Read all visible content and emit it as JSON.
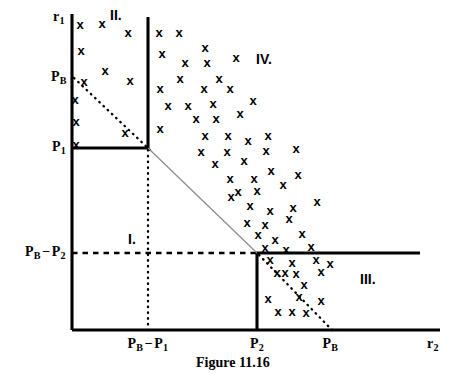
{
  "figure": {
    "caption": "Figure 11.16",
    "axes": {
      "y_label_base": "r",
      "y_label_sub": "1",
      "x_label_base": "r",
      "x_label_sub": "2"
    },
    "y_ticks": [
      {
        "name": "pb",
        "base": "P",
        "sub": "B",
        "y": 78
      },
      {
        "name": "p1",
        "base": "P",
        "sub": "1",
        "y": 148
      },
      {
        "name": "pb-minus-p2",
        "base": "P",
        "sub": "B",
        "op": "−",
        "base2": "P",
        "sub2": "2",
        "y": 253
      }
    ],
    "x_ticks": [
      {
        "name": "pb-minus-p1",
        "base": "P",
        "sub": "B",
        "op": "−",
        "base2": "P",
        "sub2": "1",
        "x": 148
      },
      {
        "name": "p2",
        "base": "P",
        "sub": "2",
        "x": 257
      },
      {
        "name": "pb",
        "base": "P",
        "sub": "B",
        "x": 330
      }
    ],
    "regions": [
      {
        "name": "region-one",
        "label": "I.",
        "x": 128,
        "y": 232
      },
      {
        "name": "region-two",
        "label": "II.",
        "x": 110,
        "y": 8
      },
      {
        "name": "region-three",
        "label": "III.",
        "x": 360,
        "y": 272
      },
      {
        "name": "region-four",
        "label": "IV.",
        "x": 256,
        "y": 52
      }
    ],
    "geometry": {
      "origin": {
        "x": 72,
        "y": 330
      },
      "y_axis_top": 14,
      "x_axis_right": 440,
      "bold_vertical_x": 148,
      "bold_vertical_top": 17,
      "bold_horizontal_p1_y": 148,
      "corner_p2": {
        "x": 257,
        "y": 253
      },
      "bold_horizontal_right_end": 420
    },
    "colors": {
      "ink": "#000000",
      "thin_diagonal": "#8a8a8a",
      "background": "#ffffff"
    },
    "lines": [
      {
        "name": "y-axis",
        "style": "solid-bold",
        "x1": 72,
        "y1": 14,
        "x2": 72,
        "y2": 330
      },
      {
        "name": "x-axis",
        "style": "solid-bold",
        "x1": 72,
        "y1": 330,
        "x2": 440,
        "y2": 330
      },
      {
        "name": "boundary-vertical-pb-minus-p1",
        "style": "solid-bold",
        "x1": 148,
        "y1": 17,
        "x2": 148,
        "y2": 149
      },
      {
        "name": "boundary-horizontal-p1",
        "style": "solid-bold",
        "x1": 72,
        "y1": 148,
        "x2": 149,
        "y2": 148
      },
      {
        "name": "boundary-vertical-p2",
        "style": "solid-bold",
        "x1": 257,
        "y1": 253,
        "x2": 257,
        "y2": 330
      },
      {
        "name": "boundary-horizontal-pb-minus-p2",
        "style": "solid-bold",
        "x1": 256,
        "y1": 253,
        "x2": 420,
        "y2": 253
      },
      {
        "name": "dotted-vertical-pb-minus-p1",
        "style": "dotted",
        "x1": 148,
        "y1": 150,
        "x2": 148,
        "y2": 330
      },
      {
        "name": "dotted-horizontal-pb-minus-p2",
        "style": "dashed",
        "x1": 72,
        "y1": 253,
        "x2": 256,
        "y2": 253
      },
      {
        "name": "dotted-diagonal-region-two",
        "style": "dotted",
        "x1": 74,
        "y1": 78,
        "x2": 150,
        "y2": 150
      },
      {
        "name": "dotted-diagonal-region-three",
        "style": "dotted",
        "x1": 259,
        "y1": 255,
        "x2": 332,
        "y2": 330
      },
      {
        "name": "thin-diagonal-budget-line",
        "style": "thin",
        "x1": 148,
        "y1": 148,
        "x2": 257,
        "y2": 253
      }
    ],
    "scatter": {
      "marker": "x",
      "points": [
        [
          80,
          24
        ],
        [
          102,
          23
        ],
        [
          128,
          32
        ],
        [
          81,
          50
        ],
        [
          105,
          70
        ],
        [
          84,
          81
        ],
        [
          130,
          80
        ],
        [
          75,
          99
        ],
        [
          76,
          121
        ],
        [
          125,
          132
        ],
        [
          76,
          144
        ],
        [
          159,
          32
        ],
        [
          179,
          32
        ],
        [
          205,
          47
        ],
        [
          162,
          53
        ],
        [
          185,
          62
        ],
        [
          207,
          62
        ],
        [
          236,
          57
        ],
        [
          180,
          78
        ],
        [
          219,
          78
        ],
        [
          160,
          88
        ],
        [
          204,
          88
        ],
        [
          230,
          88
        ],
        [
          168,
          105
        ],
        [
          188,
          105
        ],
        [
          213,
          103
        ],
        [
          253,
          100
        ],
        [
          196,
          118
        ],
        [
          216,
          118
        ],
        [
          240,
          113
        ],
        [
          160,
          128
        ],
        [
          205,
          135
        ],
        [
          228,
          135
        ],
        [
          248,
          140
        ],
        [
          268,
          135
        ],
        [
          201,
          151
        ],
        [
          227,
          151
        ],
        [
          266,
          150
        ],
        [
          296,
          148
        ],
        [
          215,
          163
        ],
        [
          244,
          160
        ],
        [
          230,
          178
        ],
        [
          254,
          178
        ],
        [
          271,
          170
        ],
        [
          298,
          174
        ],
        [
          238,
          191
        ],
        [
          257,
          190
        ],
        [
          283,
          184
        ],
        [
          231,
          196
        ],
        [
          250,
          205
        ],
        [
          270,
          210
        ],
        [
          293,
          207
        ],
        [
          317,
          201
        ],
        [
          247,
          222
        ],
        [
          265,
          224
        ],
        [
          289,
          218
        ],
        [
          258,
          234
        ],
        [
          275,
          239
        ],
        [
          302,
          233
        ],
        [
          265,
          247
        ],
        [
          286,
          249
        ],
        [
          311,
          246
        ],
        [
          270,
          259
        ],
        [
          292,
          262
        ],
        [
          316,
          259
        ],
        [
          330,
          263
        ],
        [
          277,
          272
        ],
        [
          285,
          272
        ],
        [
          296,
          273
        ],
        [
          321,
          271
        ],
        [
          304,
          284
        ],
        [
          268,
          298
        ],
        [
          299,
          296
        ],
        [
          321,
          300
        ],
        [
          278,
          311
        ],
        [
          292,
          311
        ],
        [
          306,
          312
        ]
      ]
    }
  }
}
